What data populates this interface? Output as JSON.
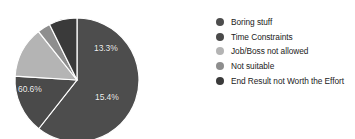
{
  "chart_data": {
    "type": "pie",
    "title": "",
    "categories": [
      "Boring stuff",
      "Time Constraints",
      "Job/Boss not allowed",
      "Not suitable",
      "End Result not Worth the Effort"
    ],
    "values": [
      60.6,
      15.4,
      13.3,
      3.4,
      7.3
    ],
    "value_labels": [
      "60.6%",
      "",
      "13.3%",
      "",
      "15.4%"
    ],
    "units": "percent",
    "legend_position": "right",
    "grid": false,
    "colors": [
      "#4d4d4d",
      "#4a4a4a",
      "#b4b4b4",
      "#8e8e8e",
      "#3a3a3a"
    ],
    "start_angle_deg": -90,
    "direction": "clockwise",
    "labels_shown": [
      "60.6%",
      "13.3%",
      "15.4%"
    ]
  },
  "legend": {
    "items": [
      {
        "label": "Boring stuff",
        "color": "#4d4d4d"
      },
      {
        "label": "Time Constraints",
        "color": "#4a4a4a"
      },
      {
        "label": "Job/Boss not allowed",
        "color": "#b4b4b4"
      },
      {
        "label": "Not suitable",
        "color": "#8e8e8e"
      },
      {
        "label": "End Result not Worth the Effort",
        "color": "#3a3a3a"
      }
    ]
  },
  "pie_labels": {
    "slice_0": "60.6%",
    "slice_2": "13.3%",
    "slice_4": "15.4%"
  }
}
